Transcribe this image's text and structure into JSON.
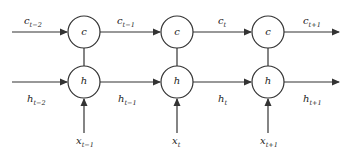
{
  "diagram": {
    "title": "",
    "columns": [
      {
        "cell_label": "c",
        "hidden_label": "h",
        "input": {
          "base": "x",
          "sub": "t−1"
        }
      },
      {
        "cell_label": "c",
        "hidden_label": "h",
        "input": {
          "base": "x",
          "sub": "t"
        }
      },
      {
        "cell_label": "c",
        "hidden_label": "h",
        "input": {
          "base": "x",
          "sub": "t+1"
        }
      }
    ],
    "cell_edges": [
      {
        "base": "c",
        "sub": "t−2"
      },
      {
        "base": "c",
        "sub": "t−1"
      },
      {
        "base": "c",
        "sub": "t"
      },
      {
        "base": "c",
        "sub": "t+1"
      }
    ],
    "hidden_edges": [
      {
        "base": "h",
        "sub": "t−2"
      },
      {
        "base": "h",
        "sub": "t−1"
      },
      {
        "base": "h",
        "sub": "t"
      },
      {
        "base": "h",
        "sub": "t+1"
      }
    ],
    "colors": {
      "stroke": "#333333",
      "background": "#ffffff",
      "text": "#222222"
    }
  }
}
